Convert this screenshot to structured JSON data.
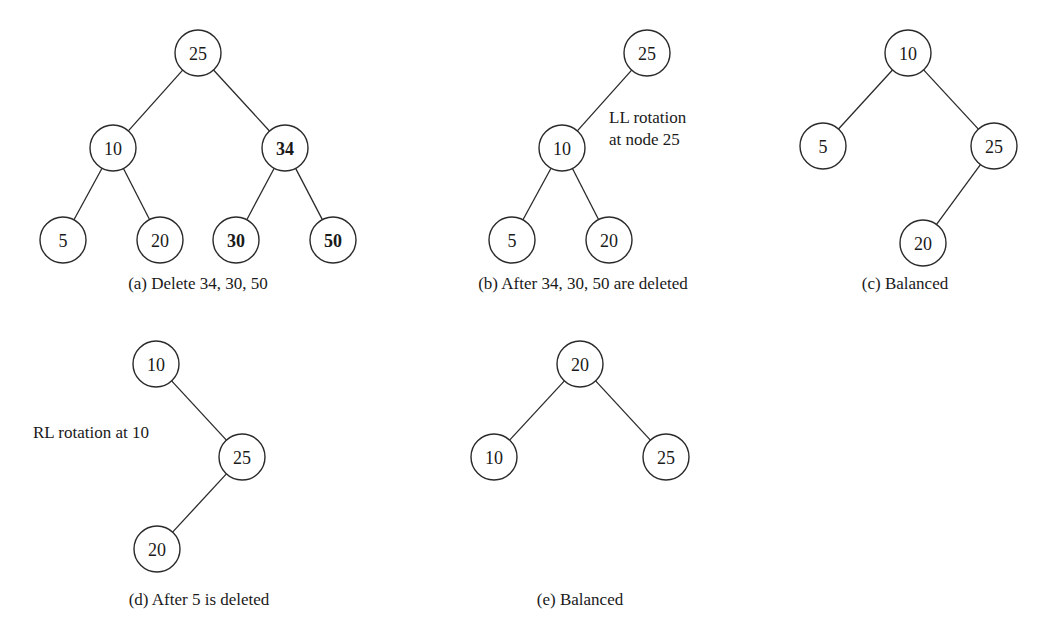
{
  "figure": {
    "node_radius": 23,
    "colors": {
      "stroke": "#2a2a2a",
      "text": "#1a1a1a",
      "background": "#ffffff"
    },
    "panels": [
      {
        "id": "a",
        "caption": "(a) Delete 34, 30, 50",
        "caption_pos": [
          198,
          283
        ],
        "nodes": [
          {
            "id": "a25",
            "label": "25",
            "x": 198,
            "y": 53,
            "bold": false
          },
          {
            "id": "a10",
            "label": "10",
            "x": 113,
            "y": 148,
            "bold": false
          },
          {
            "id": "a34",
            "label": "34",
            "x": 285,
            "y": 148,
            "bold": true
          },
          {
            "id": "a5",
            "label": "5",
            "x": 63,
            "y": 240,
            "bold": false
          },
          {
            "id": "a20",
            "label": "20",
            "x": 160,
            "y": 240,
            "bold": false
          },
          {
            "id": "a30",
            "label": "30",
            "x": 236,
            "y": 240,
            "bold": true
          },
          {
            "id": "a50",
            "label": "50",
            "x": 333,
            "y": 240,
            "bold": true
          }
        ],
        "edges": [
          [
            "a25",
            "a10"
          ],
          [
            "a25",
            "a34"
          ],
          [
            "a10",
            "a5"
          ],
          [
            "a10",
            "a20"
          ],
          [
            "a34",
            "a30"
          ],
          [
            "a34",
            "a50"
          ]
        ],
        "annotations": []
      },
      {
        "id": "b",
        "caption": "(b) After 34, 30, 50 are deleted",
        "caption_pos": [
          583,
          283
        ],
        "nodes": [
          {
            "id": "b25",
            "label": "25",
            "x": 647,
            "y": 53,
            "bold": false
          },
          {
            "id": "b10",
            "label": "10",
            "x": 562,
            "y": 148,
            "bold": false
          },
          {
            "id": "b5",
            "label": "5",
            "x": 512,
            "y": 240,
            "bold": false
          },
          {
            "id": "b20",
            "label": "20",
            "x": 609,
            "y": 240,
            "bold": false
          }
        ],
        "edges": [
          [
            "b25",
            "b10"
          ],
          [
            "b10",
            "b5"
          ],
          [
            "b10",
            "b20"
          ]
        ],
        "annotations": [
          {
            "lines": [
              "LL rotation",
              "at node 25"
            ],
            "x": 609,
            "y": 117,
            "line_height": 22
          }
        ]
      },
      {
        "id": "c",
        "caption": "(c) Balanced",
        "caption_pos": [
          905,
          283
        ],
        "nodes": [
          {
            "id": "c10",
            "label": "10",
            "x": 908,
            "y": 53,
            "bold": false
          },
          {
            "id": "c5",
            "label": "5",
            "x": 823,
            "y": 146,
            "bold": false
          },
          {
            "id": "c25",
            "label": "25",
            "x": 994,
            "y": 146,
            "bold": false
          },
          {
            "id": "c20",
            "label": "20",
            "x": 923,
            "y": 243,
            "bold": false
          }
        ],
        "edges": [
          [
            "c10",
            "c5"
          ],
          [
            "c10",
            "c25"
          ],
          [
            "c25",
            "c20"
          ]
        ],
        "annotations": []
      },
      {
        "id": "d",
        "caption": "(d) After 5 is deleted",
        "caption_pos": [
          199,
          599
        ],
        "nodes": [
          {
            "id": "d10",
            "label": "10",
            "x": 156,
            "y": 364,
            "bold": false
          },
          {
            "id": "d25",
            "label": "25",
            "x": 242,
            "y": 457,
            "bold": false
          },
          {
            "id": "d20",
            "label": "20",
            "x": 157,
            "y": 549,
            "bold": false
          }
        ],
        "edges": [
          [
            "d10",
            "d25"
          ],
          [
            "d25",
            "d20"
          ]
        ],
        "annotations": [
          {
            "lines": [
              "RL rotation at 10"
            ],
            "x": 33,
            "y": 432,
            "line_height": 22
          }
        ]
      },
      {
        "id": "e",
        "caption": "(e) Balanced",
        "caption_pos": [
          580,
          599
        ],
        "nodes": [
          {
            "id": "e20",
            "label": "20",
            "x": 580,
            "y": 364,
            "bold": false
          },
          {
            "id": "e10",
            "label": "10",
            "x": 494,
            "y": 457,
            "bold": false
          },
          {
            "id": "e25",
            "label": "25",
            "x": 666,
            "y": 457,
            "bold": false
          }
        ],
        "edges": [
          [
            "e20",
            "e10"
          ],
          [
            "e20",
            "e25"
          ]
        ],
        "annotations": []
      }
    ]
  }
}
